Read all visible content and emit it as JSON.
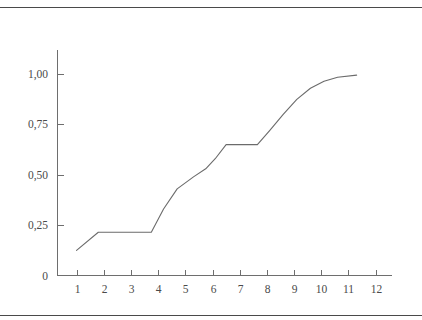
{
  "figure": {
    "background_color": "#ffffff",
    "rule_color": "#4a4a4a",
    "axis_color": "#6e6e6e",
    "curve_color": "#6b6b6b",
    "label_color": "#4a4a4a"
  },
  "chart_data": {
    "type": "line",
    "title": "",
    "subtitle": "",
    "xlabel": "",
    "ylabel": "",
    "xlim": [
      0.3,
      12.6
    ],
    "ylim": [
      0,
      1.12
    ],
    "grid": false,
    "legend": null,
    "annotations": [],
    "x_tick_labels": [
      "1",
      "2",
      "3",
      "4",
      "5",
      "6",
      "7",
      "8",
      "9",
      "10",
      "11",
      "12"
    ],
    "x_tick_values": [
      1,
      2,
      3,
      4,
      5,
      6,
      7,
      8,
      9,
      10,
      11,
      12
    ],
    "y_tick_labels": [
      "0",
      "0,25",
      "0,50",
      "0,75",
      "1,00"
    ],
    "y_tick_values": [
      0,
      0.25,
      0.5,
      0.75,
      1.0
    ],
    "series": [
      {
        "name": "cumulative-curve",
        "color": "#6b6b6b",
        "x": [
          1.0,
          1.8,
          3.75,
          4.2,
          4.7,
          5.3,
          5.75,
          6.1,
          6.5,
          7.65,
          8.1,
          8.6,
          9.1,
          9.6,
          10.1,
          10.6,
          11.3
        ],
        "y": [
          0.125,
          0.215,
          0.215,
          0.33,
          0.43,
          0.49,
          0.53,
          0.58,
          0.65,
          0.65,
          0.72,
          0.8,
          0.875,
          0.93,
          0.965,
          0.985,
          0.995
        ]
      }
    ]
  }
}
